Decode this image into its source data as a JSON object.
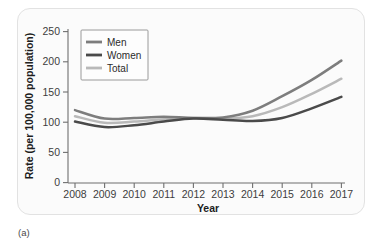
{
  "figure": {
    "caption": "(a)"
  },
  "chart_data": {
    "type": "line",
    "title": "",
    "xlabel": "Year",
    "ylabel": "Rate (per 100,000 population)",
    "categories": [
      "2008",
      "2009",
      "2010",
      "2011",
      "2012",
      "2013",
      "2014",
      "2015",
      "2016",
      "2017"
    ],
    "x": [
      2008,
      2009,
      2010,
      2011,
      2012,
      2013,
      2014,
      2015,
      2016,
      2017
    ],
    "xlim": [
      2008,
      2017
    ],
    "ylim": [
      0,
      250
    ],
    "yticks": [
      0,
      50,
      100,
      150,
      200,
      250
    ],
    "ytick_labels": [
      "0",
      "50",
      "100",
      "150",
      "200",
      "250"
    ],
    "grid": false,
    "legend_position": "top-left",
    "series": [
      {
        "name": "Men",
        "color": "#7d7d7d",
        "values": [
          120,
          106,
          107,
          109,
          107,
          108,
          119,
          143,
          170,
          202
        ]
      },
      {
        "name": "Women",
        "color": "#4a4a4a",
        "values": [
          101,
          92,
          95,
          101,
          106,
          104,
          102,
          107,
          123,
          142
        ]
      },
      {
        "name": "Total",
        "color": "#b9b9b9",
        "values": [
          110,
          99,
          101,
          105,
          107,
          106,
          110,
          125,
          147,
          172
        ]
      }
    ]
  }
}
